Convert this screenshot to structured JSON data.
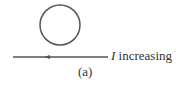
{
  "figure": {
    "loop": {
      "shape": "circle",
      "center": [
        60,
        25
      ],
      "radius": 20,
      "stroke": "#555555"
    },
    "wire": {
      "x_start": 13,
      "x_end": 108,
      "y": 57,
      "arrow_direction": "left",
      "arrow_x": 46,
      "stroke": "#555555"
    },
    "current_label": {
      "symbol": "I",
      "text": " increasing"
    },
    "caption": "(a)"
  }
}
